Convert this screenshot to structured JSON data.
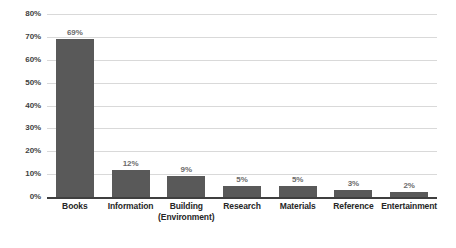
{
  "chart_data": {
    "type": "bar",
    "title": "",
    "subtitle": "",
    "xlabel": "",
    "ylabel": "",
    "ylim": [
      0,
      80
    ],
    "grid": true,
    "legend": false,
    "legend_position": "none",
    "orientation": "vertical",
    "value_suffix": "%",
    "categories": [
      "Books",
      "Information",
      "Building (Environment)",
      "Research",
      "Materials",
      "Reference",
      "Entertainment"
    ],
    "category_lines": [
      [
        "Books"
      ],
      [
        "Information"
      ],
      [
        "Building",
        "(Environment)"
      ],
      [
        "Research"
      ],
      [
        "Materials"
      ],
      [
        "Reference"
      ],
      [
        "Entertainment"
      ]
    ],
    "values": [
      69,
      12,
      9,
      5,
      5,
      3,
      2
    ],
    "data_labels": [
      "69%",
      "12%",
      "9%",
      "5%",
      "5%",
      "3%",
      "2%"
    ],
    "yticks": [
      0,
      10,
      20,
      30,
      40,
      50,
      60,
      70,
      80
    ],
    "ytick_labels": [
      "0%",
      "10%",
      "20%",
      "30%",
      "40%",
      "50%",
      "60%",
      "70%",
      "80%"
    ],
    "colors": {
      "bar": "#595959",
      "gridline": "#d9d9d9",
      "axis": "#3f3f3f",
      "tick_text": "#3f3f3f",
      "category_text": "#262626",
      "value_text": "#6b6b6b",
      "background": "#ffffff"
    }
  }
}
